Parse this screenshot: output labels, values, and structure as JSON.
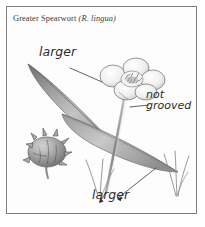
{
  "figure": {
    "caption_common": "Greater Spearwort",
    "caption_scientific": "(R. lingua)",
    "frame_color": "#7e7e7e",
    "background_color": "#fdfdfd",
    "ink_color": "#2e2e2e",
    "pencil_gray": "#8d8d8d"
  },
  "annotations": {
    "larger_top": "larger",
    "not_grooved_line1": "not",
    "not_grooved_line2": "grooved",
    "larger_bottom": "larger"
  }
}
